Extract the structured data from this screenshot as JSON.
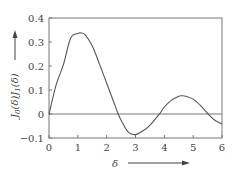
{
  "chart_data": {
    "type": "line",
    "title": "",
    "xlabel": "δ",
    "ylabel": "J₀(δ)J₁(δ)",
    "xlim": [
      0,
      6
    ],
    "ylim": [
      -0.1,
      0.4
    ],
    "xticks": [
      "0",
      "1",
      "2",
      "3",
      "4",
      "5",
      "6"
    ],
    "yticks": [
      "-0.1",
      "0",
      "0.1",
      "0.2",
      "0.3",
      "0.4"
    ],
    "grid": false,
    "zero_line": true,
    "series": [
      {
        "name": "J0(δ)J1(δ)",
        "x": [
          0,
          0.25,
          0.5,
          0.75,
          1.0,
          1.1,
          1.25,
          1.5,
          1.75,
          2.0,
          2.25,
          2.4,
          2.5,
          2.75,
          3.0,
          3.25,
          3.5,
          3.83,
          4.0,
          4.25,
          4.5,
          4.6,
          4.75,
          5.0,
          5.25,
          5.52,
          5.75,
          6.0
        ],
        "y": [
          0,
          0.122,
          0.206,
          0.316,
          0.336,
          0.338,
          0.331,
          0.283,
          0.208,
          0.128,
          0.048,
          0.0,
          -0.026,
          -0.076,
          -0.086,
          -0.071,
          -0.047,
          0.0,
          0.029,
          0.058,
          0.074,
          0.076,
          0.074,
          0.062,
          0.036,
          0.0,
          -0.026,
          -0.042
        ]
      }
    ]
  },
  "labels": {
    "x_axis": "δ",
    "y_axis_main": "J",
    "y_axis_sub1": "0",
    "y_axis_mid": "(δ)J",
    "y_axis_sub2": "1",
    "y_axis_end": "(δ)"
  }
}
